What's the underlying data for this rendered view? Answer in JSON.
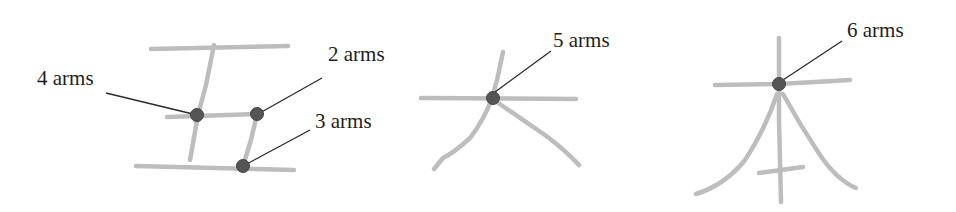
{
  "diagram": {
    "colors": {
      "stroke": "#bdbdbd",
      "node": "#555555",
      "leader": "#2a2a2a",
      "text": "#1e1e1e"
    },
    "characters": [
      {
        "glyph": "五",
        "junctions": [
          {
            "label": "4 arms",
            "arms": 4
          },
          {
            "label": "2 arms",
            "arms": 2
          },
          {
            "label": "3 arms",
            "arms": 3
          }
        ]
      },
      {
        "glyph": "大",
        "junctions": [
          {
            "label": "5 arms",
            "arms": 5
          }
        ]
      },
      {
        "glyph": "本",
        "junctions": [
          {
            "label": "6 arms",
            "arms": 6
          }
        ]
      }
    ]
  }
}
